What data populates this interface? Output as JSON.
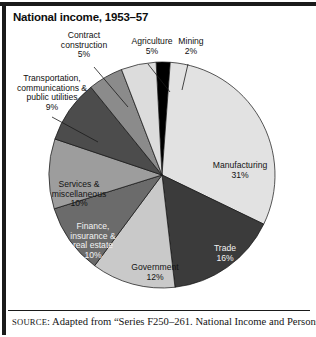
{
  "figure": {
    "title": "National income, 1953–57",
    "source_prefix": "SOURCE",
    "source_text": ": Adapted from “Series F250–261. National Income and Persons"
  },
  "chart_data": {
    "type": "pie",
    "title": "National income, 1953–57",
    "unit": "percent",
    "start_angle_deg": -3,
    "direction": "clockwise",
    "legend": "none (direct labels)",
    "categories": [
      "Mining",
      "Manufacturing",
      "Trade",
      "Government",
      "Finance, insurance & real estate",
      "Services & miscellaneous",
      "Transportation, communications & public utilities",
      "Contract construction",
      "Agriculture"
    ],
    "values": [
      2,
      31,
      16,
      12,
      10,
      10,
      9,
      5,
      5
    ],
    "colors": [
      "#000000",
      "#e2e2e2",
      "#3b3b3b",
      "#c9c9c9",
      "#6b6b6b",
      "#9d9d9d",
      "#4c4c4c",
      "#8b8b8b",
      "#dcdcdc"
    ],
    "slices": [
      {
        "name": "Mining",
        "label": "Mining",
        "value_label": "2%",
        "value": 2,
        "color": "#000000",
        "label_placement": "outside-leader"
      },
      {
        "name": "Manufacturing",
        "label": "Manufacturing",
        "value_label": "31%",
        "value": 31,
        "color": "#e2e2e2",
        "label_placement": "inside"
      },
      {
        "name": "Trade",
        "label": "Trade",
        "value_label": "16%",
        "value": 16,
        "color": "#3b3b3b",
        "label_placement": "inside"
      },
      {
        "name": "Government",
        "label": "Government",
        "value_label": "12%",
        "value": 12,
        "color": "#c9c9c9",
        "label_placement": "inside"
      },
      {
        "name": "Finance, insurance & real estate",
        "label": "Finance,\ninsurance &\nreal estate",
        "value_label": "10%",
        "value": 10,
        "color": "#6b6b6b",
        "label_placement": "inside"
      },
      {
        "name": "Services & miscellaneous",
        "label": "Services &\nmiscellaneous",
        "value_label": "10%",
        "value": 10,
        "color": "#9d9d9d",
        "label_placement": "inside"
      },
      {
        "name": "Transportation, communications & public utilities",
        "label": "Transportation,\ncommunications &\npublic utilities",
        "value_label": "9%",
        "value": 9,
        "color": "#4c4c4c",
        "label_placement": "outside-leader"
      },
      {
        "name": "Contract construction",
        "label": "Contract\nconstruction",
        "value_label": "5%",
        "value": 5,
        "color": "#8b8b8b",
        "label_placement": "outside-leader"
      },
      {
        "name": "Agriculture",
        "label": "Agriculture",
        "value_label": "5%",
        "value": 5,
        "color": "#dcdcdc",
        "label_placement": "outside-leader"
      }
    ],
    "labels_text": {
      "agriculture": "Agriculture\n5%",
      "mining": "Mining\n2%",
      "contract_construction": "Contract\nconstruction\n5%",
      "transportation": "Transportation,\ncommunications &\npublic utilities\n9%",
      "services": "Services &\nmiscellaneous\n10%",
      "finance": "Finance,\ninsurance &\nreal estate\n10%",
      "government": "Government\n12%",
      "trade": "Trade\n16%",
      "manufacturing": "Manufacturing\n31%"
    }
  }
}
